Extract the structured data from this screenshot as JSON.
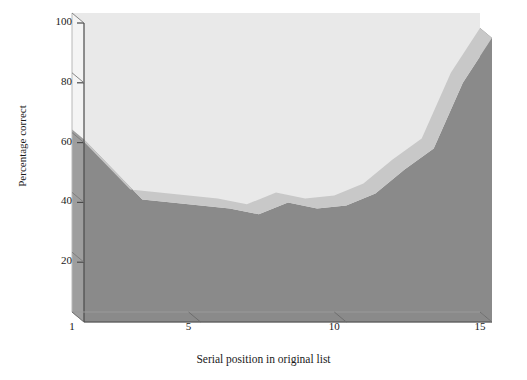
{
  "chart_data": {
    "type": "area",
    "title": "",
    "subtitle": "",
    "xlabel": "Serial position in original list",
    "ylabel": "Percentage correct",
    "x": [
      1,
      2,
      3,
      4,
      5,
      6,
      7,
      8,
      9,
      10,
      11,
      12,
      13,
      14,
      15
    ],
    "values": [
      61,
      51,
      41,
      40,
      39,
      38,
      36,
      40,
      38,
      39,
      43,
      51,
      58,
      80,
      95
    ],
    "series": [
      {
        "name": "Percentage correct",
        "values": [
          61,
          51,
          41,
          40,
          39,
          38,
          36,
          40,
          38,
          39,
          43,
          51,
          58,
          80,
          95
        ]
      }
    ],
    "xlim": [
      1,
      15
    ],
    "ylim": [
      0,
      100
    ],
    "xticks": [
      1,
      5,
      10,
      15
    ],
    "yticks": [
      20,
      40,
      60,
      80,
      100
    ],
    "xtick_labels": [
      "1",
      "5",
      "10",
      "15"
    ],
    "ytick_labels": [
      "20",
      "40",
      "60",
      "80",
      "100"
    ],
    "grid": true,
    "grid_color": "#ffffff",
    "legend": null,
    "style": "3d-area",
    "colors": {
      "plot_background": "#e9e9e9",
      "area_front": "#8a8a8a",
      "area_top_ribbon": "#c8c8c8",
      "area_side": "#6e6e6e",
      "axis": "#4a4a4a",
      "text": "#1a1a1a",
      "page_background": "#ffffff"
    }
  },
  "axes": {
    "y": {
      "label": "Percentage correct",
      "ticks": [
        "20",
        "40",
        "60",
        "80",
        "100"
      ]
    },
    "x": {
      "label": "Serial position in original list",
      "ticks": [
        "1",
        "5",
        "10",
        "15"
      ]
    }
  }
}
